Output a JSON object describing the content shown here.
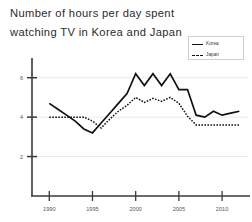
{
  "title": {
    "line1": "Number of hours per day spent",
    "line2": "watching TV in Korea and Japan"
  },
  "legend": {
    "position": "top-right",
    "entries": [
      {
        "label": "Korea",
        "style": "solid",
        "color": "#111111"
      },
      {
        "label": "Japan",
        "style": "dashed",
        "color": "#111111"
      }
    ]
  },
  "axes": {
    "y_ticks": [
      "2",
      "4",
      "6"
    ],
    "x_ticks": [
      "1990",
      "1995",
      "2000",
      "2005",
      "2010"
    ]
  },
  "chart_data": {
    "type": "line",
    "title": "Number of hours per day spent watching TV in Korea and Japan",
    "xlabel": "",
    "ylabel": "",
    "xlim": [
      1988,
      2013
    ],
    "ylim": [
      0,
      7
    ],
    "yticks": [
      2,
      4,
      6
    ],
    "xticks": [
      1990,
      1995,
      2000,
      2005,
      2010
    ],
    "grid": "horizontal",
    "legend_position": "top-right",
    "series": [
      {
        "name": "Korea",
        "style": "solid",
        "color": "#111111",
        "x": [
          1990,
          1991,
          1992,
          1993,
          1994,
          1995,
          1996,
          1997,
          1998,
          1999,
          2000,
          2001,
          2002,
          2003,
          2004,
          2005,
          2006,
          2007,
          2008,
          2009,
          2010,
          2011,
          2012
        ],
        "values": [
          4.7,
          4.4,
          4.1,
          3.8,
          3.4,
          3.2,
          3.7,
          4.2,
          4.7,
          5.2,
          6.2,
          5.6,
          6.2,
          5.6,
          6.2,
          5.4,
          5.4,
          4.1,
          4.0,
          4.3,
          4.1,
          4.2,
          4.3
        ]
      },
      {
        "name": "Japan",
        "style": "dashed",
        "color": "#111111",
        "x": [
          1990,
          1991,
          1992,
          1993,
          1994,
          1995,
          1996,
          1997,
          1998,
          1999,
          2000,
          2001,
          2002,
          2003,
          2004,
          2005,
          2006,
          2007,
          2008,
          2009,
          2010,
          2011,
          2012
        ],
        "values": [
          4.0,
          4.0,
          4.0,
          4.0,
          4.0,
          3.8,
          3.45,
          3.9,
          4.3,
          4.6,
          5.0,
          4.75,
          4.95,
          4.8,
          5.0,
          4.7,
          4.05,
          3.6,
          3.6,
          3.6,
          3.6,
          3.6,
          3.6
        ]
      }
    ]
  }
}
